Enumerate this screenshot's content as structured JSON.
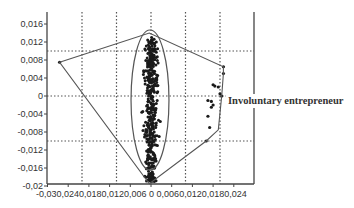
{
  "chart_data": {
    "type": "scatter",
    "title": "",
    "xlabel": "",
    "ylabel": "",
    "xlim": [
      -0.03,
      0.03
    ],
    "ylim": [
      -0.02,
      0.018
    ],
    "x_ticks": [
      "-0,03",
      "0,024",
      "0,018",
      "0,012",
      "0,006",
      "0",
      "0,006",
      "0,012",
      "0,018",
      "0,024"
    ],
    "x_tick_values": [
      -0.03,
      -0.024,
      -0.018,
      -0.012,
      -0.006,
      0,
      0.006,
      0.012,
      0.018,
      0.024
    ],
    "x_tick_label_text": "-0,030,0240,0180,0120,006  0  0,0060,0120,0180,024",
    "y_ticks": [
      "0,016",
      "0,012",
      "0,008",
      "0,004",
      "0",
      "-0,004",
      "-0,008",
      "-0,012",
      "-0,016",
      "-0,02"
    ],
    "y_tick_values": [
      0.016,
      0.012,
      0.008,
      0.004,
      0,
      -0.004,
      -0.008,
      -0.012,
      -0.016,
      -0.02
    ],
    "grid": {
      "style": "dotted",
      "x": [
        -0.02,
        -0.01,
        0,
        0.01,
        0.02
      ],
      "y": [
        0.01,
        0,
        -0.01
      ]
    },
    "annotations": [
      {
        "text": "Involuntary entrepreneur",
        "x": 0.022,
        "y": -0.002
      }
    ],
    "overlays": {
      "ellipse": {
        "center": [
          0,
          0.0
        ],
        "semi_axis_x": 0.0055,
        "semi_axis_y": 0.0155,
        "label": "main cluster"
      },
      "convex_hull": [
        [
          -0.0265,
          0.0075
        ],
        [
          -0.0005,
          0.014
        ],
        [
          0.021,
          0.0065
        ],
        [
          0.021,
          0.005
        ],
        [
          0.0205,
          0.0
        ],
        [
          0.0195,
          -0.0075
        ],
        [
          0.016,
          -0.01
        ],
        [
          -0.0005,
          -0.0195
        ]
      ]
    },
    "series": [
      {
        "name": "main cluster",
        "description": "dense vertical cloud of points centered near x=0, spanning y≈-0.019 to 0.013",
        "x_range": [
          -0.004,
          0.004
        ],
        "y_range": [
          -0.019,
          0.013
        ],
        "approx_count": 400
      },
      {
        "name": "outliers (involuntary entrepreneur)",
        "points": [
          [
            0.021,
            0.0065
          ],
          [
            0.021,
            0.005
          ],
          [
            0.018,
            0.0025
          ],
          [
            0.0185,
            0.0022
          ],
          [
            0.0195,
            0.002
          ],
          [
            0.02,
            0.0005
          ],
          [
            0.0165,
            -0.001
          ],
          [
            0.0175,
            -0.0012
          ],
          [
            0.018,
            -0.002
          ],
          [
            0.0175,
            -0.0025
          ],
          [
            0.0165,
            -0.0045
          ],
          [
            0.017,
            -0.007
          ],
          [
            0.016,
            -0.01
          ],
          [
            0.0205,
            0.0
          ]
        ]
      },
      {
        "name": "left outlier",
        "points": [
          [
            -0.0265,
            0.0075
          ]
        ]
      }
    ]
  },
  "labels": {
    "annotation": "Involuntary entrepreneur",
    "x_ticks": [
      "-0,03",
      "0,024",
      "0,018",
      "0,012",
      "0,006",
      "0",
      "0,006",
      "0,012",
      "0,018",
      "0,024"
    ],
    "y_ticks": [
      "0,016",
      "0,012",
      "0,008",
      "0,004",
      "0",
      "-0,004",
      "-0,008",
      "-0,012",
      "-0,016",
      "-0,02"
    ]
  }
}
